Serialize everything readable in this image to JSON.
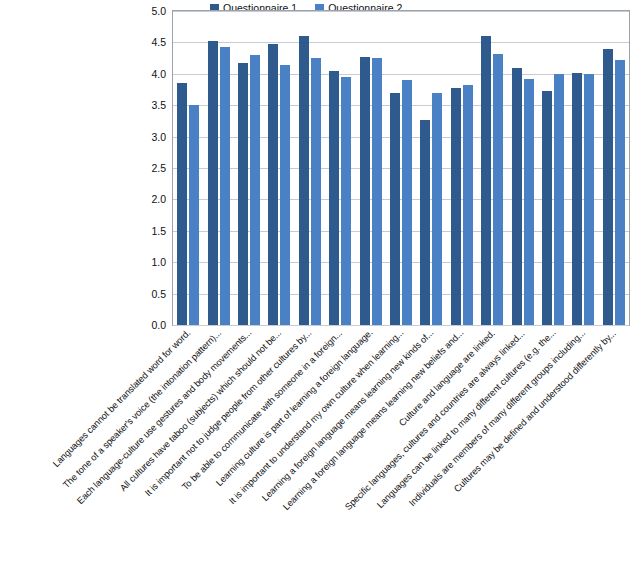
{
  "chart_data": {
    "type": "bar",
    "title": "",
    "xlabel": "",
    "ylabel": "",
    "ylim": [
      0.0,
      5.0
    ],
    "grid": true,
    "legend_position": "top-center",
    "ytick_labels": [
      "5.0",
      "4.5",
      "4.0",
      "3.5",
      "3.0",
      "2.5",
      "2.0",
      "1.5",
      "1.0",
      "0.5",
      "0.0"
    ],
    "ytick_values": [
      5.0,
      4.5,
      4.0,
      3.5,
      3.0,
      2.5,
      2.0,
      1.5,
      1.0,
      0.5,
      0.0
    ],
    "categories": [
      "Languages cannot be translated word for word.",
      "The tone of a speaker's voice (the intonation pattern)...",
      "Each language-culture use gestures and body movements...",
      "All cultures have taboo  (subjects) which should not be...",
      "It is important not to judge people from other cultures by...",
      "To be able to communicate with someone in a foreign...",
      "Learning culture is part of learning a foreign language.",
      "It is important to understand my own culture when learning...",
      "Learning a foreign language means learning new kinds of...",
      "Learning a foreign language means learning new beliefs and...",
      "Culture and language are linked.",
      "Specific languages, cultures and countries are always linked...",
      "Languages can be linked to many different cultures (e.g. the...",
      "Individuals are members of many different groups including...",
      "Cultures may be defined and understood differently by..."
    ],
    "series": [
      {
        "name": "Questionnaire 1",
        "color": "#2e5a8e",
        "values": [
          3.85,
          4.52,
          4.17,
          4.47,
          4.6,
          4.05,
          4.27,
          3.7,
          3.27,
          3.78,
          4.6,
          4.1,
          3.72,
          4.02,
          4.4
        ]
      },
      {
        "name": "Questionnaire 2",
        "color": "#4a81c4",
        "values": [
          3.5,
          4.42,
          4.3,
          4.14,
          4.25,
          3.95,
          4.25,
          3.9,
          3.7,
          3.82,
          4.32,
          3.92,
          4.0,
          4.0,
          4.22
        ]
      }
    ]
  },
  "legend": {
    "entries": [
      {
        "label": "Questionnaire 1"
      },
      {
        "label": "Questionnaire 2"
      }
    ]
  }
}
